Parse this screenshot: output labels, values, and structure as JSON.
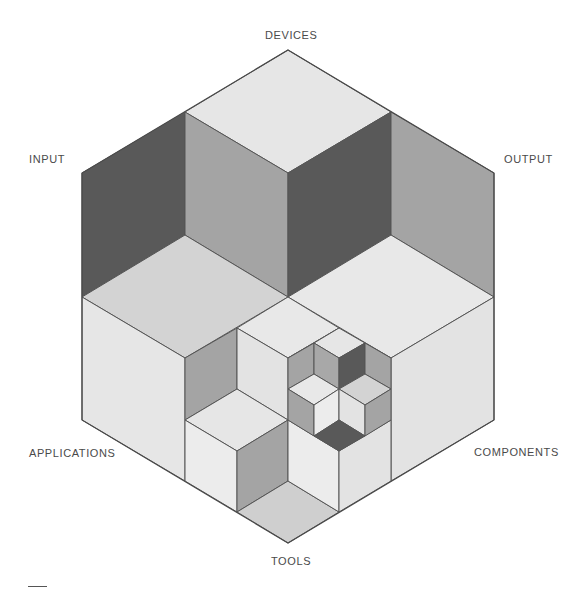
{
  "diagram": {
    "type": "recursive isometric cube hexagon",
    "labels": {
      "top": "DEVICES",
      "upper_left": "INPUT",
      "upper_right": "OUTPUT",
      "lower_left": "APPLICATIONS",
      "lower_right": "COMPONENTS",
      "bottom": "TOOLS"
    },
    "colors": {
      "light": "#e6e6e6",
      "lighter": "#ececec",
      "mid_light": "#cfcfcf",
      "medium": "#a4a4a4",
      "dark": "#595959",
      "stroke": "#555555",
      "text": "#4a4a4a"
    }
  }
}
